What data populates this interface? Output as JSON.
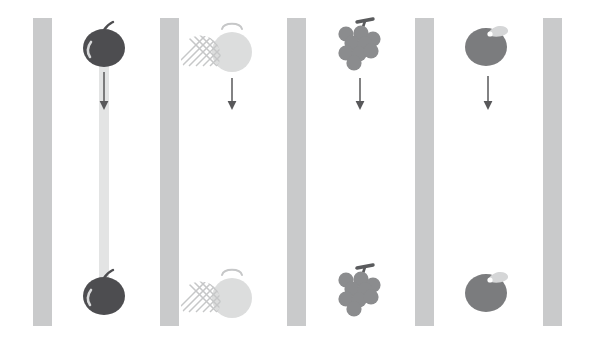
{
  "scene": {
    "title": "Falling fruit sequence",
    "width": 592,
    "height": 344,
    "background_color": "#ffffff",
    "bar_color": "#c9cacb",
    "trail_color": "#e3e4e4",
    "arrow_color": "#58585a"
  },
  "bars": [
    {
      "name": "bar-1",
      "x": 33,
      "y": 18,
      "width": 19,
      "height": 308
    },
    {
      "name": "bar-2",
      "x": 160,
      "y": 18,
      "width": 19,
      "height": 308
    },
    {
      "name": "bar-3",
      "x": 287,
      "y": 18,
      "width": 19,
      "height": 308
    },
    {
      "name": "bar-4",
      "x": 415,
      "y": 18,
      "width": 19,
      "height": 308
    },
    {
      "name": "bar-5",
      "x": 543,
      "y": 18,
      "width": 19,
      "height": 308
    }
  ],
  "trail": {
    "name": "apple-fall-trail",
    "x": 99,
    "y": 55,
    "width": 10,
    "height": 240
  },
  "columns": [
    {
      "id": "apple",
      "fruit_name": "apple",
      "label": "Apple",
      "center_x": 104,
      "body_color": "#4d4d50",
      "detail_color": "#d8d9da",
      "top_y": 45,
      "bottom_y": 293,
      "arrow": {
        "x": 104,
        "y1": 72,
        "y2": 110
      },
      "has_trail": true
    },
    {
      "id": "melon",
      "fruit_name": "melon",
      "label": "Melon",
      "center_x": 232,
      "body_color": "#dcdddd",
      "detail_color": "#c6c7c8",
      "top_y": 47,
      "bottom_y": 293,
      "arrow": {
        "x": 232,
        "y1": 78,
        "y2": 110
      },
      "has_trail": false
    },
    {
      "id": "grapes",
      "fruit_name": "grapes",
      "label": "Grapes",
      "center_x": 360,
      "body_color": "#8b8c8e",
      "detail_color": "#5a5b5d",
      "top_y": 45,
      "bottom_y": 291,
      "arrow": {
        "x": 360,
        "y1": 78,
        "y2": 110
      },
      "has_trail": false
    },
    {
      "id": "peach",
      "fruit_name": "peach",
      "label": "Peach",
      "center_x": 488,
      "body_color": "#7b7c7e",
      "detail_color": "#d5d6d7",
      "top_y": 45,
      "bottom_y": 291,
      "arrow": {
        "x": 488,
        "y1": 76,
        "y2": 110
      },
      "has_trail": false
    }
  ]
}
